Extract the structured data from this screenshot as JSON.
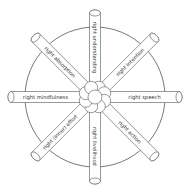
{
  "diagram": {
    "center": [
      95,
      97
    ],
    "rim_radius": 70,
    "spoke_length": 84,
    "spoke_width": 11,
    "colors": {
      "stroke": "#555555",
      "fill": "#ffffff",
      "text": "#333333"
    },
    "spokes": [
      {
        "id": "understanding",
        "label": "right understanding",
        "angle": -90
      },
      {
        "id": "intention",
        "label": "right intention",
        "angle": -45
      },
      {
        "id": "speech",
        "label": "right speech",
        "angle": 0
      },
      {
        "id": "action",
        "label": "right action",
        "angle": 45
      },
      {
        "id": "livelihood",
        "label": "right livelihood",
        "angle": 90
      },
      {
        "id": "effort",
        "label": "right (inner) effort",
        "angle": 135
      },
      {
        "id": "mindfulness",
        "label": "right mindfulness",
        "angle": 180
      },
      {
        "id": "absorption",
        "label": "right absorption",
        "angle": -135
      }
    ]
  }
}
